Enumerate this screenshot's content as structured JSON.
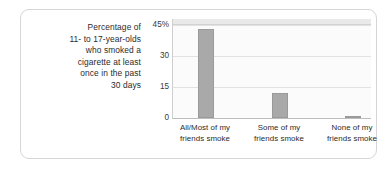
{
  "caption": {
    "lines": [
      "Percentage of",
      "11- to 17-year-olds",
      "who smoked a",
      "cigarette at least",
      "once in the past",
      "30 days"
    ]
  },
  "colors": {
    "bar": "#a9a9a9",
    "bar_border": "#9a9a9a",
    "plot_background": "#fbfbfb",
    "gridline": "#e2e2e2",
    "axis": "#bdbdbd",
    "card_border": "#d6d6d6",
    "text": "#2b2b2b"
  },
  "chart_data": {
    "type": "bar",
    "title": "",
    "subtitle": "",
    "xlabel": "",
    "ylabel": "Percentage of 11- to 17-year-olds who smoked a cigarette at least once in the past 30 days",
    "categories": [
      "All/Most of my friends smoke",
      "Some of my friends smoke",
      "None of my friends smoke"
    ],
    "category_lines": [
      [
        "All/Most of my",
        "friends smoke"
      ],
      [
        "Some of my",
        "friends smoke"
      ],
      [
        "None of my",
        "friends smoke"
      ]
    ],
    "values": [
      43,
      12,
      1
    ],
    "ylim": [
      0,
      45
    ],
    "yticks": [
      0,
      15,
      30,
      45
    ],
    "ytick_labels": [
      "0",
      "15",
      "30",
      "45%"
    ],
    "grid": true,
    "legend": "none"
  }
}
